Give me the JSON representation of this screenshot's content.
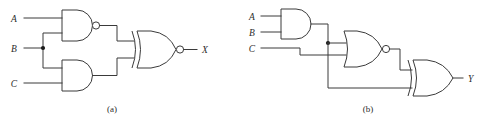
{
  "figure": {
    "background": "#ffffff",
    "line_color": "#3a3a3a",
    "width": 489,
    "height": 122
  },
  "circuit_a": {
    "caption": "(a)",
    "inputs": [
      {
        "label": "A",
        "x": 14,
        "y": 18
      },
      {
        "label": "B",
        "x": 14,
        "y": 51
      },
      {
        "label": "C",
        "x": 14,
        "y": 85
      }
    ],
    "outputs": [
      {
        "label": "X",
        "x": 200,
        "y": 49
      }
    ],
    "gates": [
      {
        "name": "nand-gate",
        "type": "NAND",
        "inputs": [
          "A",
          "B"
        ],
        "bubble": true
      },
      {
        "name": "and-gate",
        "type": "AND",
        "inputs": [
          "B",
          "C"
        ],
        "bubble": false
      },
      {
        "name": "xnor-gate",
        "type": "XNOR",
        "inputs": [
          "nand-out",
          "and-out"
        ],
        "bubble": true
      }
    ],
    "junctions": [
      {
        "name": "b-fanout",
        "x": 43,
        "y": 48
      }
    ]
  },
  "circuit_b": {
    "caption": "(b)",
    "inputs": [
      {
        "label": "A",
        "x": 252,
        "y": 16
      },
      {
        "label": "B",
        "x": 252,
        "y": 32
      },
      {
        "label": "C",
        "x": 252,
        "y": 50
      }
    ],
    "outputs": [
      {
        "label": "Y",
        "x": 466,
        "y": 73
      }
    ],
    "gates": [
      {
        "name": "and-gate",
        "type": "AND",
        "inputs": [
          "A",
          "B"
        ],
        "bubble": false
      },
      {
        "name": "nor-gate",
        "type": "NOR",
        "inputs": [
          "and-out",
          "C"
        ],
        "bubble": true
      },
      {
        "name": "xor-gate",
        "type": "XOR",
        "inputs": [
          "nor-out",
          "and-out"
        ],
        "bubble": false
      }
    ],
    "junctions": [
      {
        "name": "and-out-fanout",
        "x": 328,
        "y": 43
      }
    ]
  }
}
